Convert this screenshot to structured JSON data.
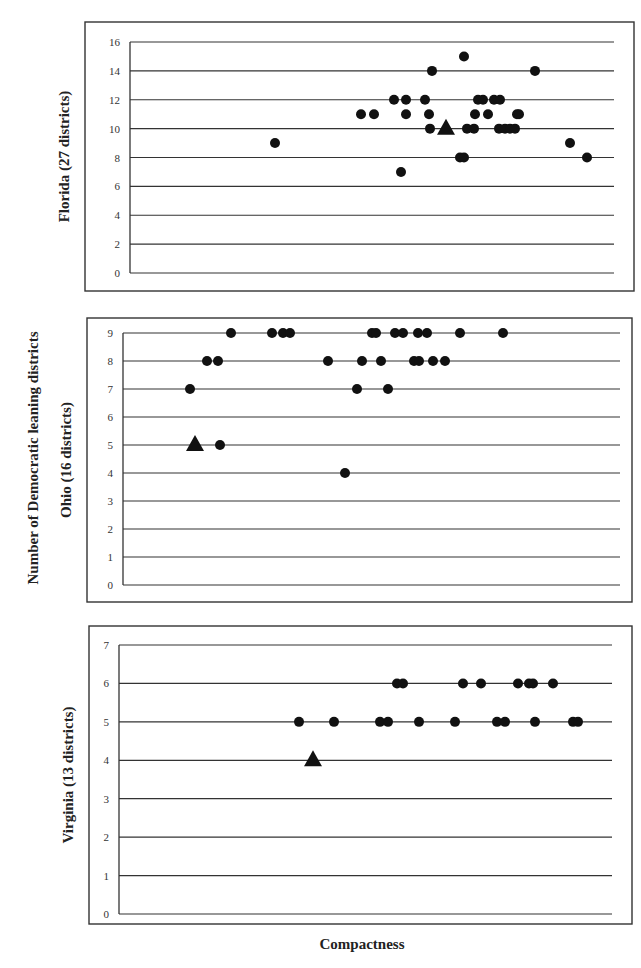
{
  "figure": {
    "shared_ylabel": "Number of Democratic leaning districts",
    "xlabel": "Compactness"
  },
  "chart_data": [
    {
      "type": "scatter",
      "panel": "Florida",
      "ylabel": "Florida (27 districts)",
      "xlabel": "Compactness",
      "ylim": [
        0,
        16
      ],
      "yticks": [
        0,
        2,
        4,
        6,
        8,
        10,
        12,
        14,
        16
      ],
      "grid": true,
      "x_axis_ticks": false,
      "frame": {
        "box": [
          85,
          22,
          634,
          291
        ],
        "plot": [
          130,
          42,
          614,
          273
        ]
      },
      "series": [
        {
          "name": "Simulated plans",
          "marker": "circle",
          "points": [
            [
              275,
              9
            ],
            [
              361,
              11
            ],
            [
              374,
              11
            ],
            [
              394,
              12
            ],
            [
              406,
              12
            ],
            [
              406,
              11
            ],
            [
              425,
              12
            ],
            [
              429,
              11
            ],
            [
              430,
              10
            ],
            [
              432,
              14
            ],
            [
              401,
              7
            ],
            [
              464,
              15
            ],
            [
              467,
              10
            ],
            [
              474,
              10
            ],
            [
              460,
              8
            ],
            [
              464,
              8
            ],
            [
              475,
              11
            ],
            [
              478,
              12
            ],
            [
              483,
              12
            ],
            [
              488,
              11
            ],
            [
              494,
              12
            ],
            [
              500,
              12
            ],
            [
              499,
              10
            ],
            [
              505,
              10
            ],
            [
              510,
              10
            ],
            [
              515,
              10
            ],
            [
              517,
              11
            ],
            [
              519,
              11
            ],
            [
              535,
              14
            ],
            [
              570,
              9
            ],
            [
              587,
              8
            ]
          ]
        },
        {
          "name": "Enacted plan",
          "marker": "triangle",
          "points": [
            [
              446,
              10
            ]
          ]
        }
      ]
    },
    {
      "type": "scatter",
      "panel": "Ohio",
      "ylabel": "Ohio (16 districts)",
      "xlabel": "Compactness",
      "ylim": [
        0,
        9
      ],
      "yticks": [
        0,
        1,
        2,
        3,
        4,
        5,
        6,
        7,
        8,
        9
      ],
      "grid": true,
      "x_axis_ticks": false,
      "frame": {
        "box": [
          87,
          318,
          632,
          602
        ],
        "plot": [
          123,
          333,
          620,
          585
        ]
      },
      "series": [
        {
          "name": "Simulated plans",
          "marker": "circle",
          "points": [
            [
              231,
              9
            ],
            [
              272,
              9
            ],
            [
              283,
              9
            ],
            [
              290,
              9
            ],
            [
              372,
              9
            ],
            [
              376,
              9
            ],
            [
              395,
              9
            ],
            [
              403,
              9
            ],
            [
              418,
              9
            ],
            [
              427,
              9
            ],
            [
              460,
              9
            ],
            [
              503,
              9
            ],
            [
              207,
              8
            ],
            [
              218,
              8
            ],
            [
              328,
              8
            ],
            [
              362,
              8
            ],
            [
              381,
              8
            ],
            [
              414,
              8
            ],
            [
              419,
              8
            ],
            [
              433,
              8
            ],
            [
              445,
              8
            ],
            [
              190,
              7
            ],
            [
              357,
              7
            ],
            [
              388,
              7
            ],
            [
              220,
              5
            ],
            [
              345,
              4
            ]
          ]
        },
        {
          "name": "Enacted plan",
          "marker": "triangle",
          "points": [
            [
              195,
              5
            ]
          ]
        }
      ]
    },
    {
      "type": "scatter",
      "panel": "Virginia",
      "ylabel": "Virginia (13 districts)",
      "xlabel": "Compactness",
      "ylim": [
        0,
        7
      ],
      "yticks": [
        0,
        1,
        2,
        3,
        4,
        5,
        6,
        7
      ],
      "grid": true,
      "x_axis_ticks": false,
      "frame": {
        "box": [
          89,
          626,
          632,
          924
        ],
        "plot": [
          119,
          645,
          612,
          914
        ]
      },
      "series": [
        {
          "name": "Simulated plans",
          "marker": "circle",
          "points": [
            [
              397,
              6
            ],
            [
              403,
              6
            ],
            [
              463,
              6
            ],
            [
              481,
              6
            ],
            [
              518,
              6
            ],
            [
              529,
              6
            ],
            [
              533,
              6
            ],
            [
              553,
              6
            ],
            [
              299,
              5
            ],
            [
              334,
              5
            ],
            [
              380,
              5
            ],
            [
              388,
              5
            ],
            [
              419,
              5
            ],
            [
              455,
              5
            ],
            [
              497,
              5
            ],
            [
              505,
              5
            ],
            [
              535,
              5
            ],
            [
              573,
              5
            ],
            [
              578,
              5
            ]
          ]
        },
        {
          "name": "Enacted plan",
          "marker": "triangle",
          "points": [
            [
              313,
              4
            ]
          ]
        }
      ]
    }
  ]
}
